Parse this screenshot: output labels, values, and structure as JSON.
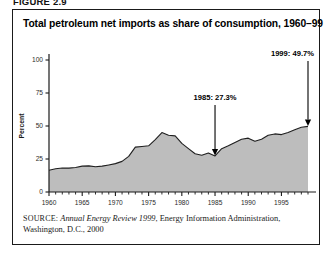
{
  "figure": {
    "caption": "FIGURE 2.9"
  },
  "chart_title": "Total petroleum net imports as share of consumption, 1960–99",
  "source": {
    "label": "SOURCE:",
    "italic_part": "Annual Energy Review 1999",
    "rest": ", Energy Information Administration, Washington, D.C., 2000"
  },
  "colors": {
    "area_fill": "#bdbdbd",
    "area_line": "#1f1f1f",
    "axis": "#1a1a1a",
    "border": "#1a1a1a",
    "text": "#000000"
  },
  "chart_data": {
    "type": "area",
    "title": "Total petroleum net imports as share of consumption, 1960–99",
    "xlabel": "",
    "ylabel": "Percent",
    "xlim": [
      1960,
      1999
    ],
    "ylim": [
      0,
      100
    ],
    "yticks": [
      0,
      25,
      50,
      75,
      100
    ],
    "ytick_labels": [
      "0",
      "25",
      "50",
      "75",
      "100"
    ],
    "xticks": [
      1960,
      1965,
      1970,
      1975,
      1980,
      1985,
      1990,
      1995
    ],
    "xtick_labels": [
      "1960",
      "1965",
      "1970",
      "1975",
      "1980",
      "1985",
      "1990",
      "1995"
    ],
    "minor_xtick_interval": 1,
    "grid": false,
    "legend": null,
    "x": [
      1960,
      1961,
      1962,
      1963,
      1964,
      1965,
      1966,
      1967,
      1968,
      1969,
      1970,
      1971,
      1972,
      1973,
      1974,
      1975,
      1976,
      1977,
      1978,
      1979,
      1980,
      1981,
      1982,
      1983,
      1984,
      1985,
      1986,
      1987,
      1988,
      1989,
      1990,
      1991,
      1992,
      1993,
      1994,
      1995,
      1996,
      1997,
      1998,
      1999
    ],
    "values": [
      16.5,
      17.6,
      18.2,
      18.1,
      18.6,
      19.6,
      19.8,
      19.1,
      19.6,
      20.5,
      21.5,
      23.2,
      27.0,
      34.0,
      34.5,
      35.0,
      39.7,
      45.0,
      43.0,
      42.5,
      36.8,
      32.9,
      29.0,
      27.8,
      29.5,
      27.3,
      32.8,
      35.0,
      37.5,
      40.0,
      40.8,
      38.4,
      40.0,
      43.0,
      44.0,
      43.5,
      45.1,
      47.1,
      49.0,
      49.7
    ],
    "annotations": [
      {
        "name": "1985-annotation",
        "label": "1985: 27.3%",
        "x": 1985,
        "y": 27.3
      },
      {
        "name": "1999-annotation",
        "label": "1999: 49.7%",
        "x": 1999,
        "y": 49.7
      }
    ]
  }
}
